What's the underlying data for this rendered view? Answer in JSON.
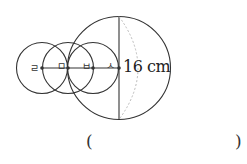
{
  "diagram": {
    "points": [
      {
        "label": "ㄹ",
        "x": 42
      },
      {
        "label": "ㅁ",
        "x": 68
      },
      {
        "label": "ㅂ",
        "x": 93
      },
      {
        "label": "ㅅ",
        "x": 119
      }
    ],
    "axis_y": 68,
    "small_radius": 25.5,
    "large_circle": {
      "cx": 119,
      "cy": 68,
      "r": 51.5
    },
    "measurement_label": "16 cm",
    "line_color": "#333333",
    "dashed_color": "#bbbbbb"
  },
  "answer": {
    "open_paren": "(",
    "close_paren": ")",
    "value": ""
  }
}
